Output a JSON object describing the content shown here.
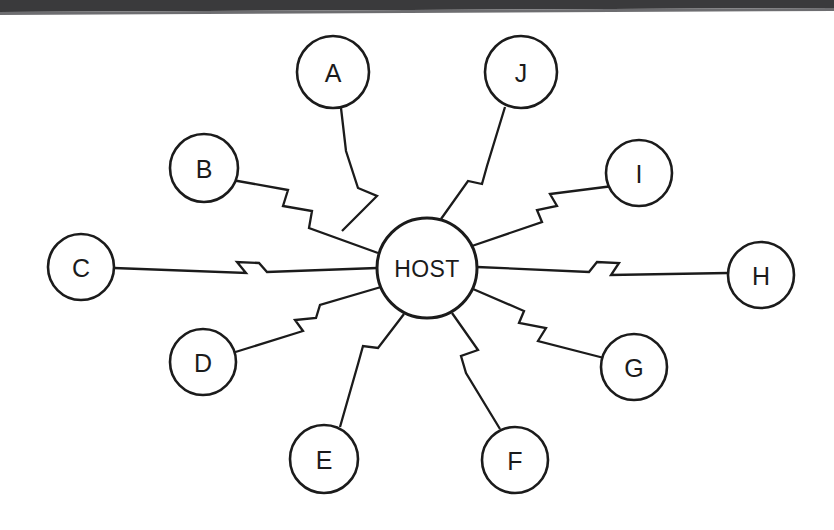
{
  "diagram": {
    "type": "star-topology",
    "hub": {
      "id": "host",
      "label": "HOST",
      "cx": 427,
      "cy": 268,
      "r": 50
    },
    "nodes": [
      {
        "id": "a",
        "label": "A",
        "cx": 333,
        "cy": 72,
        "r": 36
      },
      {
        "id": "b",
        "label": "B",
        "cx": 204,
        "cy": 168,
        "r": 34
      },
      {
        "id": "c",
        "label": "C",
        "cx": 81,
        "cy": 267,
        "r": 33
      },
      {
        "id": "d",
        "label": "D",
        "cx": 203,
        "cy": 362,
        "r": 33
      },
      {
        "id": "e",
        "label": "E",
        "cx": 324,
        "cy": 459,
        "r": 34
      },
      {
        "id": "f",
        "label": "F",
        "cx": 515,
        "cy": 460,
        "r": 33
      },
      {
        "id": "g",
        "label": "G",
        "cx": 634,
        "cy": 367,
        "r": 33
      },
      {
        "id": "h",
        "label": "H",
        "cx": 761,
        "cy": 275,
        "r": 33
      },
      {
        "id": "i",
        "label": "I",
        "cx": 639,
        "cy": 173,
        "r": 33
      },
      {
        "id": "j",
        "label": "J",
        "cx": 521,
        "cy": 72,
        "r": 36
      }
    ],
    "links": [
      {
        "id": "link-host-a",
        "from": "host",
        "to": "a",
        "path": "M 342 231 L 377 196 L 358 188 L 346 151 L 341 108"
      },
      {
        "id": "link-host-b",
        "from": "host",
        "to": "b",
        "path": "M 378 253 L 309 228 L 312 211 L 283 206 L 288 190 L 232 180"
      },
      {
        "id": "link-host-c",
        "from": "host",
        "to": "c",
        "path": "M 377 268 L 267 272 L 259 263 L 237 262 L 246 273 L 114 268"
      },
      {
        "id": "link-host-d",
        "from": "host",
        "to": "d",
        "path": "M 381 287 L 320 305 L 316 318 L 295 320 L 303 331 L 229 354"
      },
      {
        "id": "link-host-e",
        "from": "host",
        "to": "e",
        "path": "M 404 314 L 378 348 L 363 346 L 358 364 L 340 427"
      },
      {
        "id": "link-host-f",
        "from": "host",
        "to": "f",
        "path": "M 452 313 L 478 350 L 461 356 L 466 373 L 500 429"
      },
      {
        "id": "link-host-g",
        "from": "host",
        "to": "g",
        "path": "M 473 289 L 524 311 L 519 323 L 546 328 L 538 341 L 604 358"
      },
      {
        "id": "link-host-h",
        "from": "host",
        "to": "h",
        "path": "M 477 267 L 589 272 L 597 262 L 619 263 L 611 275 L 728 273"
      },
      {
        "id": "link-host-i",
        "from": "host",
        "to": "i",
        "path": "M 469 247 L 542 222 L 537 210 L 557 206 L 550 194 L 613 186"
      },
      {
        "id": "link-host-j",
        "from": "host",
        "to": "j",
        "path": "M 441 219 L 468 181 L 482 184 L 487 166 L 505 107"
      }
    ],
    "page": {
      "background_color": "#ffffff",
      "stroke_color": "#1b1b1b",
      "scan_edge_color": "#3a3a3c"
    }
  }
}
